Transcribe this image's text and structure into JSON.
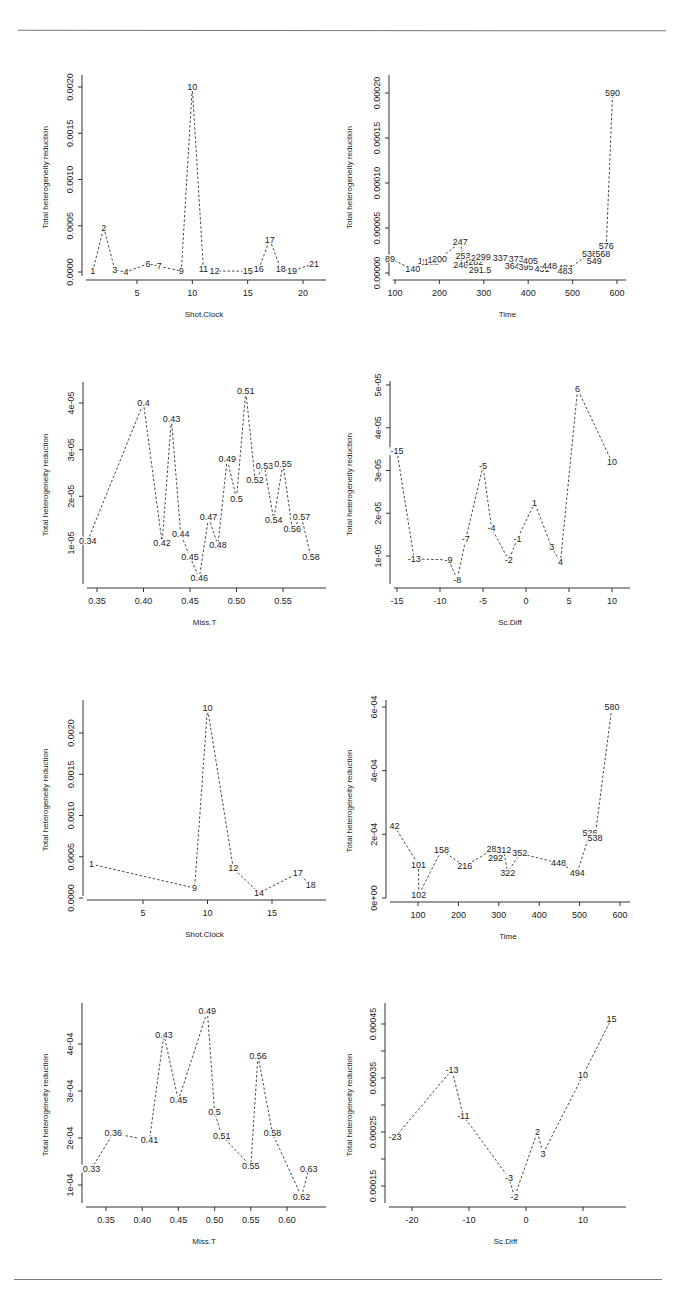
{
  "page": {
    "rules": [
      "top-divider",
      "bottom-divider"
    ]
  },
  "chart_data": [
    {
      "id": "p1",
      "type": "line",
      "title": "",
      "xlabel": "Shot.Clock",
      "ylabel": "Total heterogeneity reduction",
      "xticks": [
        5,
        10,
        15,
        20
      ],
      "xtick_labels": [
        "5",
        "10",
        "15",
        "20"
      ],
      "yticks": [
        0,
        0.0005,
        0.001,
        0.0015,
        0.002
      ],
      "ytick_labels": [
        "0.0000",
        "0.0005",
        "0.0010",
        "0.0015",
        "0.0020"
      ],
      "grid": false,
      "legend": null,
      "points": [
        {
          "x": 1,
          "y": 1e-05,
          "label": "1"
        },
        {
          "x": 2,
          "y": 0.00048,
          "label": "2"
        },
        {
          "x": 3,
          "y": 2e-05,
          "label": "3"
        },
        {
          "x": 4,
          "y": 0.0,
          "label": "4"
        },
        {
          "x": 6,
          "y": 9e-05,
          "label": "6"
        },
        {
          "x": 7,
          "y": 6e-05,
          "label": "7"
        },
        {
          "x": 9,
          "y": 1e-05,
          "label": "9"
        },
        {
          "x": 10,
          "y": 0.002,
          "label": "10"
        },
        {
          "x": 11,
          "y": 3e-05,
          "label": "11"
        },
        {
          "x": 12,
          "y": 1e-05,
          "label": "12"
        },
        {
          "x": 15,
          "y": 1e-05,
          "label": "15"
        },
        {
          "x": 16,
          "y": 3e-05,
          "label": "16"
        },
        {
          "x": 17,
          "y": 0.00035,
          "label": "17"
        },
        {
          "x": 18,
          "y": 3e-05,
          "label": "18"
        },
        {
          "x": 19,
          "y": 1e-05,
          "label": "19"
        },
        {
          "x": 21,
          "y": 9e-05,
          "label": "21"
        }
      ]
    },
    {
      "id": "p2",
      "type": "line",
      "title": "",
      "xlabel": "Time",
      "ylabel": "Total heterogeneity reduction",
      "xticks": [
        100,
        200,
        300,
        400,
        500,
        600
      ],
      "xtick_labels": [
        "100",
        "200",
        "300",
        "400",
        "500",
        "600"
      ],
      "yticks": [
        0,
        5e-05,
        0.0001,
        0.00015,
        0.0002
      ],
      "ytick_labels": [
        "0.00000",
        "0.00005",
        "0.00010",
        "0.00015",
        "0.00020"
      ],
      "grid": false,
      "legend": null,
      "points": [
        {
          "x": 89,
          "y": 1.6e-05,
          "label": "89"
        },
        {
          "x": 140,
          "y": 4e-06,
          "label": "140"
        },
        {
          "x": 168,
          "y": 1.3e-05,
          "label": "168"
        },
        {
          "x": 176,
          "y": 1.2e-05,
          "label": "176"
        },
        {
          "x": 182,
          "y": 1.2e-05,
          "label": "182"
        },
        {
          "x": 190,
          "y": 1.4e-05,
          "label": "190"
        },
        {
          "x": 200,
          "y": 1.6e-05,
          "label": "200"
        },
        {
          "x": 247,
          "y": 3.4e-05,
          "label": "247"
        },
        {
          "x": 253,
          "y": 1.9e-05,
          "label": "253"
        },
        {
          "x": 248,
          "y": 9e-06,
          "label": "248"
        },
        {
          "x": 275,
          "y": 1.4e-05,
          "label": "275"
        },
        {
          "x": 282,
          "y": 1.2e-05,
          "label": "282"
        },
        {
          "x": 288,
          "y": 1.7e-05,
          "label": "288"
        },
        {
          "x": 291.5,
          "y": 3e-06,
          "label": "291.5"
        },
        {
          "x": 299,
          "y": 1.8e-05,
          "label": "299"
        },
        {
          "x": 337,
          "y": 1.7e-05,
          "label": "337"
        },
        {
          "x": 373,
          "y": 1.6e-05,
          "label": "373"
        },
        {
          "x": 364,
          "y": 8e-06,
          "label": "364"
        },
        {
          "x": 395,
          "y": 7e-06,
          "label": "395"
        },
        {
          "x": 405,
          "y": 1.3e-05,
          "label": "405"
        },
        {
          "x": 431,
          "y": 4e-06,
          "label": "431"
        },
        {
          "x": 448,
          "y": 8e-06,
          "label": "448"
        },
        {
          "x": 484,
          "y": 6e-06,
          "label": "484"
        },
        {
          "x": 483,
          "y": 2e-06,
          "label": "483"
        },
        {
          "x": 538,
          "y": 2.1e-05,
          "label": "538"
        },
        {
          "x": 549,
          "y": 1.3e-05,
          "label": "549"
        },
        {
          "x": 568,
          "y": 2.1e-05,
          "label": "568"
        },
        {
          "x": 576,
          "y": 3e-05,
          "label": "576"
        },
        {
          "x": 590,
          "y": 0.0002,
          "label": "590"
        }
      ]
    },
    {
      "id": "p3",
      "type": "line",
      "title": "",
      "xlabel": "Miss.T",
      "ylabel": "Total heterogeneity reduction",
      "xticks": [
        0.35,
        0.4,
        0.45,
        0.5,
        0.55
      ],
      "xtick_labels": [
        "0.35",
        "0.40",
        "0.45",
        "0.50",
        "0.55"
      ],
      "yticks": [
        1e-05,
        2e-05,
        3e-05,
        4e-05
      ],
      "ytick_labels": [
        "1e-05",
        "2e-05",
        "3e-05",
        "4e-05"
      ],
      "grid": false,
      "legend": null,
      "points": [
        {
          "x": 0.34,
          "y": 1.05e-05,
          "label": "0.34"
        },
        {
          "x": 0.4,
          "y": 4e-05,
          "label": "0.4"
        },
        {
          "x": 0.42,
          "y": 1e-05,
          "label": "0.42"
        },
        {
          "x": 0.43,
          "y": 3.65e-05,
          "label": "0.43"
        },
        {
          "x": 0.44,
          "y": 1.2e-05,
          "label": "0.44"
        },
        {
          "x": 0.45,
          "y": 7e-06,
          "label": "0.45"
        },
        {
          "x": 0.46,
          "y": 2.5e-06,
          "label": "0.46"
        },
        {
          "x": 0.47,
          "y": 1.55e-05,
          "label": "0.47"
        },
        {
          "x": 0.48,
          "y": 9.5e-06,
          "label": "0.48"
        },
        {
          "x": 0.49,
          "y": 2.8e-05,
          "label": "0.49"
        },
        {
          "x": 0.5,
          "y": 1.95e-05,
          "label": "0.5"
        },
        {
          "x": 0.51,
          "y": 4.25e-05,
          "label": "0.51"
        },
        {
          "x": 0.52,
          "y": 2.35e-05,
          "label": "0.52"
        },
        {
          "x": 0.53,
          "y": 2.65e-05,
          "label": "0.53"
        },
        {
          "x": 0.54,
          "y": 1.5e-05,
          "label": "0.54"
        },
        {
          "x": 0.55,
          "y": 2.7e-05,
          "label": "0.55"
        },
        {
          "x": 0.56,
          "y": 1.3e-05,
          "label": "0.56"
        },
        {
          "x": 0.57,
          "y": 1.55e-05,
          "label": "0.57"
        },
        {
          "x": 0.58,
          "y": 7e-06,
          "label": "0.58"
        }
      ]
    },
    {
      "id": "p4",
      "type": "line",
      "title": "",
      "xlabel": "Sc.Diff",
      "ylabel": "Total heterogeneity reduction",
      "xticks": [
        -15,
        -10,
        -5,
        0,
        5,
        10
      ],
      "xtick_labels": [
        "-15",
        "-10",
        "-5",
        "0",
        "5",
        "10"
      ],
      "yticks": [
        1e-05,
        2e-05,
        3e-05,
        4e-05,
        5e-05
      ],
      "ytick_labels": [
        "1e-05",
        "2e-05",
        "3e-05",
        "4e-05",
        "5e-05"
      ],
      "grid": false,
      "legend": null,
      "points": [
        {
          "x": -15,
          "y": 3.45e-05,
          "label": "-15"
        },
        {
          "x": -13,
          "y": 9.3e-06,
          "label": "-13"
        },
        {
          "x": -9,
          "y": 9.1e-06,
          "label": "-9"
        },
        {
          "x": -8,
          "y": 4.5e-06,
          "label": "-8"
        },
        {
          "x": -7,
          "y": 1.4e-05,
          "label": "-7"
        },
        {
          "x": -5,
          "y": 3.1e-05,
          "label": "-5"
        },
        {
          "x": -4,
          "y": 1.65e-05,
          "label": "-4"
        },
        {
          "x": -2,
          "y": 9e-06,
          "label": "-2"
        },
        {
          "x": -1,
          "y": 1.4e-05,
          "label": "-1"
        },
        {
          "x": 1,
          "y": 2.25e-05,
          "label": "1"
        },
        {
          "x": 3,
          "y": 1.2e-05,
          "label": "3"
        },
        {
          "x": 4,
          "y": 8.5e-06,
          "label": "4"
        },
        {
          "x": 6,
          "y": 4.9e-05,
          "label": "6"
        },
        {
          "x": 10,
          "y": 3.2e-05,
          "label": "10"
        }
      ]
    },
    {
      "id": "p5",
      "type": "line",
      "title": "",
      "xlabel": "Shot.Clock",
      "ylabel": "Total heterogeneity reduction",
      "xticks": [
        5,
        10,
        15
      ],
      "xtick_labels": [
        "5",
        "10",
        "15"
      ],
      "yticks": [
        0,
        0.0005,
        0.001,
        0.0015,
        0.002
      ],
      "ytick_labels": [
        "0.0000",
        "0.0005",
        "0.0010",
        "0.0015",
        "0.0020"
      ],
      "grid": false,
      "legend": null,
      "points": [
        {
          "x": 1,
          "y": 0.00041,
          "label": "1"
        },
        {
          "x": 9,
          "y": 0.00012,
          "label": "9"
        },
        {
          "x": 10,
          "y": 0.0023,
          "label": "10"
        },
        {
          "x": 12,
          "y": 0.00036,
          "label": "12"
        },
        {
          "x": 14,
          "y": 6e-05,
          "label": "14"
        },
        {
          "x": 17,
          "y": 0.0003,
          "label": "17"
        },
        {
          "x": 18,
          "y": 0.00016,
          "label": "18"
        }
      ]
    },
    {
      "id": "p6",
      "type": "line",
      "title": "",
      "xlabel": "Time",
      "ylabel": "Total heterogeneity reduction",
      "xticks": [
        100,
        200,
        300,
        400,
        500,
        600
      ],
      "xtick_labels": [
        "100",
        "200",
        "300",
        "400",
        "500",
        "600"
      ],
      "yticks": [
        0,
        0.0002,
        0.0004,
        0.0006
      ],
      "ytick_labels": [
        "0e+00",
        "2e-04",
        "4e-04",
        "6e-04"
      ],
      "grid": false,
      "legend": null,
      "points": [
        {
          "x": 42,
          "y": 0.000225,
          "label": "42"
        },
        {
          "x": 101,
          "y": 0.000105,
          "label": "101"
        },
        {
          "x": 102,
          "y": 1e-05,
          "label": "102"
        },
        {
          "x": 158,
          "y": 0.00015,
          "label": "158"
        },
        {
          "x": 216,
          "y": 0.0001,
          "label": "216"
        },
        {
          "x": 288,
          "y": 0.000155,
          "label": "288"
        },
        {
          "x": 292,
          "y": 0.000125,
          "label": "292"
        },
        {
          "x": 312,
          "y": 0.00015,
          "label": "312"
        },
        {
          "x": 322,
          "y": 8e-05,
          "label": "322"
        },
        {
          "x": 352,
          "y": 0.00014,
          "label": "352"
        },
        {
          "x": 448,
          "y": 0.00011,
          "label": "448"
        },
        {
          "x": 494,
          "y": 8e-05,
          "label": "494"
        },
        {
          "x": 526,
          "y": 0.000205,
          "label": "526"
        },
        {
          "x": 538,
          "y": 0.00019,
          "label": "538"
        },
        {
          "x": 580,
          "y": 0.0006,
          "label": "580"
        }
      ]
    },
    {
      "id": "p7",
      "type": "line",
      "title": "",
      "xlabel": "Miss.T",
      "ylabel": "Total heterogeneity reduction",
      "xticks": [
        0.35,
        0.4,
        0.45,
        0.5,
        0.55,
        0.6
      ],
      "xtick_labels": [
        "0.35",
        "0.40",
        "0.45",
        "0.50",
        "0.55",
        "0.60"
      ],
      "yticks": [
        0.0001,
        0.0002,
        0.0003,
        0.0004
      ],
      "ytick_labels": [
        "1e-04",
        "2e-04",
        "3e-04",
        "4e-04"
      ],
      "grid": false,
      "legend": null,
      "points": [
        {
          "x": 0.33,
          "y": 0.000135,
          "label": "0.33"
        },
        {
          "x": 0.36,
          "y": 0.00021,
          "label": "0.36"
        },
        {
          "x": 0.41,
          "y": 0.000195,
          "label": "0.41"
        },
        {
          "x": 0.43,
          "y": 0.00042,
          "label": "0.43"
        },
        {
          "x": 0.45,
          "y": 0.00028,
          "label": "0.45"
        },
        {
          "x": 0.49,
          "y": 0.00047,
          "label": "0.49"
        },
        {
          "x": 0.5,
          "y": 0.000255,
          "label": "0.5"
        },
        {
          "x": 0.51,
          "y": 0.000205,
          "label": "0.51"
        },
        {
          "x": 0.55,
          "y": 0.00014,
          "label": "0.55"
        },
        {
          "x": 0.56,
          "y": 0.000375,
          "label": "0.56"
        },
        {
          "x": 0.58,
          "y": 0.00021,
          "label": "0.58"
        },
        {
          "x": 0.62,
          "y": 7.5e-05,
          "label": "0.62"
        },
        {
          "x": 0.63,
          "y": 0.000135,
          "label": "0.63"
        }
      ]
    },
    {
      "id": "p8",
      "type": "line",
      "title": "",
      "xlabel": "Sc.Diff",
      "ylabel": "Total heterogeneity reduction",
      "xticks": [
        -20,
        -10,
        0,
        10
      ],
      "xtick_labels": [
        "-20",
        "-10",
        "0",
        "10"
      ],
      "yticks": [
        0.00015,
        0.0002,
        0.00025,
        0.0003,
        0.00035,
        0.0004,
        0.00045
      ],
      "ytick_labels": [
        "0.00015",
        "",
        "0.00025",
        "",
        "0.00035",
        "",
        "0.00045"
      ],
      "grid": false,
      "legend": null,
      "points": [
        {
          "x": -23,
          "y": 0.00024,
          "label": "-23"
        },
        {
          "x": -13,
          "y": 0.000365,
          "label": "-13"
        },
        {
          "x": -11,
          "y": 0.00028,
          "label": "-11"
        },
        {
          "x": -3,
          "y": 0.000165,
          "label": "-3"
        },
        {
          "x": -2,
          "y": 0.00013,
          "label": "-2"
        },
        {
          "x": 2,
          "y": 0.00025,
          "label": "2"
        },
        {
          "x": 3,
          "y": 0.00021,
          "label": "3"
        },
        {
          "x": 10,
          "y": 0.000355,
          "label": "10"
        },
        {
          "x": 15,
          "y": 0.00046,
          "label": "15"
        }
      ]
    }
  ]
}
